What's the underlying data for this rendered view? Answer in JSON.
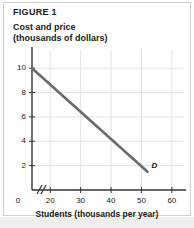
{
  "figure": {
    "number_label": "FIGURE 1",
    "subtitle_line1": "Cost and price",
    "subtitle_line2": "(thousands of dollars)",
    "xaxis_title": "Students (thousands per year)",
    "origin_label": "0",
    "curve_label": "D"
  },
  "chart_data": {
    "type": "line",
    "title": "FIGURE 1",
    "subtitle": "Cost and price (thousands of dollars)",
    "xlabel": "Students (thousands per year)",
    "ylabel": "Cost and price (thousands of dollars)",
    "series": [
      {
        "name": "D",
        "label": "D",
        "color": "#6b6b6b",
        "x": [
          14,
          52
        ],
        "y": [
          10,
          1.5
        ]
      }
    ],
    "xlim": [
      14,
      64
    ],
    "ylim": [
      0,
      11
    ],
    "xticks": [
      20,
      30,
      40,
      50,
      60
    ],
    "xtick_labels": [
      "20",
      "30",
      "40",
      "50",
      "60"
    ],
    "yticks": [
      2,
      4,
      6,
      8,
      10
    ],
    "ytick_labels": [
      "2",
      "4",
      "6",
      "8",
      "10"
    ],
    "origin_tick_label": "0",
    "axis_break": true,
    "grid": true,
    "grid_color": "#e4e4e4",
    "legend": "none",
    "annotations": [
      {
        "text": "D",
        "x": 53,
        "y": 1.2,
        "style": "italic-bold"
      }
    ]
  },
  "colors": {
    "line": "#6b6b6b",
    "axis": "#333333",
    "grid": "#e4e4e4",
    "frame": "#cfcfcf",
    "text": "#1a1a1a",
    "background": "#ffffff",
    "bottom_band": "#eeeeee"
  }
}
